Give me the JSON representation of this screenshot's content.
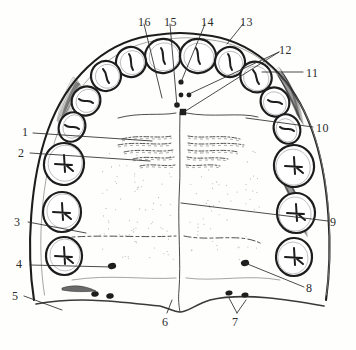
{
  "figure": {
    "kind": "line-drawing",
    "ink_color": "#1d1d1d",
    "paper_color": "#fefefd",
    "label_color": "#2b2b2b"
  },
  "labels": [
    {
      "id": "1",
      "text": "1",
      "x": 22,
      "y": 126
    },
    {
      "id": "2",
      "text": "2",
      "x": 18,
      "y": 147
    },
    {
      "id": "3",
      "text": "3",
      "x": 14,
      "y": 216
    },
    {
      "id": "4",
      "text": "4",
      "x": 16,
      "y": 258
    },
    {
      "id": "5",
      "text": "5",
      "x": 12,
      "y": 290
    },
    {
      "id": "6",
      "text": "6",
      "x": 162,
      "y": 316
    },
    {
      "id": "7",
      "text": "7",
      "x": 232,
      "y": 316
    },
    {
      "id": "8",
      "text": "8",
      "x": 306,
      "y": 282
    },
    {
      "id": "9",
      "text": "9",
      "x": 330,
      "y": 216
    },
    {
      "id": "10",
      "text": "10",
      "x": 316,
      "y": 122
    },
    {
      "id": "11",
      "text": "11",
      "x": 306,
      "y": 67
    },
    {
      "id": "12",
      "text": "12",
      "x": 279,
      "y": 44
    },
    {
      "id": "13",
      "text": "13",
      "x": 240,
      "y": 16
    },
    {
      "id": "14",
      "text": "14",
      "x": 201,
      "y": 16
    },
    {
      "id": "15",
      "text": "15",
      "x": 164,
      "y": 16
    },
    {
      "id": "16",
      "text": "16",
      "x": 138,
      "y": 16
    }
  ],
  "leaders": [
    {
      "id": "1",
      "path": "M33,133 L152,141"
    },
    {
      "id": "2",
      "path": "M30,153 L150,161"
    },
    {
      "id": "3",
      "path": "M28,222 L86,233"
    },
    {
      "id": "4",
      "path": "M30,265 L112,267"
    },
    {
      "id": "5",
      "path": "M24,296 L62,310"
    },
    {
      "id": "6",
      "path": "M167,313 L172,300"
    },
    {
      "id": "7",
      "path": "M237,313 L229,298 M237,313 L246,300"
    },
    {
      "id": "8",
      "path": "M304,287 L245,263"
    },
    {
      "id": "9",
      "path": "M328,221 L181,203"
    },
    {
      "id": "10",
      "path": "M313,127 L246,118"
    },
    {
      "id": "11",
      "path": "M303,72 L262,72"
    },
    {
      "id": "12",
      "path": "M279,52 L184,112 M279,52 L187,95"
    },
    {
      "id": "13",
      "path": "M243,24 L227,44"
    },
    {
      "id": "14",
      "path": "M205,24 L181,82"
    },
    {
      "id": "15",
      "path": "M170,24 L177,106"
    },
    {
      "id": "16",
      "path": "M144,24 L162,98"
    }
  ],
  "arch_outline": {
    "name": "palate-outline",
    "path": "M34,300 C26,250 30,180 48,130 C66,80 102,44 148,36 C162,34 176,33 180,33 C186,33 198,34 212,36 C258,44 294,80 312,130 C330,180 333,250 326,300"
  },
  "teeth_left": [
    {
      "name": "tooth-central-incisor-left",
      "cx": 163,
      "cy": 56,
      "rx": 18,
      "ry": 17,
      "rot": -8,
      "mark": "incisal"
    },
    {
      "name": "tooth-lateral-incisor-left",
      "cx": 131,
      "cy": 62,
      "rx": 15,
      "ry": 15,
      "rot": -20,
      "mark": "incisal"
    },
    {
      "name": "tooth-canine-left",
      "cx": 106,
      "cy": 76,
      "rx": 15,
      "ry": 15,
      "rot": -34,
      "mark": "cusp"
    },
    {
      "name": "tooth-first-premolar-left",
      "cx": 86,
      "cy": 101,
      "rx": 15,
      "ry": 14,
      "rot": -52,
      "mark": "ridge"
    },
    {
      "name": "tooth-second-premolar-left",
      "cx": 72,
      "cy": 127,
      "rx": 15,
      "ry": 13,
      "rot": -66,
      "mark": "ridge"
    },
    {
      "name": "tooth-first-molar-left",
      "cx": 64,
      "cy": 164,
      "rx": 21,
      "ry": 20,
      "rot": -80,
      "mark": "cross"
    },
    {
      "name": "tooth-second-molar-left",
      "cx": 62,
      "cy": 212,
      "rx": 20,
      "ry": 19,
      "rot": -88,
      "mark": "cross"
    },
    {
      "name": "tooth-third-molar-left",
      "cx": 64,
      "cy": 256,
      "rx": 19,
      "ry": 18,
      "rot": -92,
      "mark": "cross"
    }
  ],
  "teeth_right": [
    {
      "name": "tooth-central-incisor-right",
      "cx": 198,
      "cy": 56,
      "rx": 18,
      "ry": 17,
      "rot": 8,
      "mark": "incisal"
    },
    {
      "name": "tooth-lateral-incisor-right",
      "cx": 230,
      "cy": 62,
      "rx": 15,
      "ry": 15,
      "rot": 20,
      "mark": "incisal"
    },
    {
      "name": "tooth-canine-right",
      "cx": 256,
      "cy": 77,
      "rx": 16,
      "ry": 15,
      "rot": 34,
      "mark": "cusp"
    },
    {
      "name": "tooth-first-premolar-right",
      "cx": 275,
      "cy": 102,
      "rx": 15,
      "ry": 14,
      "rot": 52,
      "mark": "ridge"
    },
    {
      "name": "tooth-second-premolar-right",
      "cx": 287,
      "cy": 129,
      "rx": 15,
      "ry": 13,
      "rot": 66,
      "mark": "ridge"
    },
    {
      "name": "tooth-first-molar-right",
      "cx": 294,
      "cy": 166,
      "rx": 21,
      "ry": 20,
      "rot": 80,
      "mark": "cross"
    },
    {
      "name": "tooth-second-molar-right",
      "cx": 296,
      "cy": 213,
      "rx": 20,
      "ry": 19,
      "rot": 88,
      "mark": "cross"
    },
    {
      "name": "tooth-third-molar-right",
      "cx": 294,
      "cy": 257,
      "rx": 19,
      "ry": 18,
      "rot": 92,
      "mark": "cross"
    }
  ],
  "midline": {
    "name": "palatine-raphe",
    "path": "M180,112 C179,140 181,170 179,200 C178,230 181,262 179,290 C178,300 179,306 180,312"
  },
  "rugae_left": [
    "M122,139 C140,134 156,139 172,136",
    "M118,145 C138,141 156,146 172,143",
    "M124,152 C142,148 158,153 173,150",
    "M133,159 C148,155 161,160 174,157",
    "M140,166 C152,163 164,167 175,165"
  ],
  "rugae_right": [
    "M188,136 C204,139 222,134 240,139",
    "M188,143 C206,146 224,141 244,145",
    "M188,150 C204,153 220,148 238,152",
    "M187,157 C200,160 214,156 228,159",
    "M186,165 C197,167 209,163 220,166"
  ],
  "papilla_dots": [
    {
      "name": "incisive-papilla-dot",
      "cx": 181,
      "cy": 82,
      "r": 2.6
    },
    {
      "name": "palatine-foramen-dot",
      "cx": 177,
      "cy": 105,
      "r": 2.8
    },
    {
      "name": "palatine-foramen-dot",
      "cx": 181,
      "cy": 95,
      "r": 2.4
    },
    {
      "name": "palatine-foramen-dot",
      "cx": 189,
      "cy": 95,
      "r": 2.4
    },
    {
      "name": "incisive-fossa-square",
      "cx": 183,
      "cy": 112,
      "r": 3.2
    }
  ],
  "gland_dots": [
    {
      "name": "greater-palatine-foramen-left",
      "cx": 112,
      "cy": 266,
      "r": 3.4
    },
    {
      "name": "greater-palatine-foramen-right",
      "cx": 245,
      "cy": 263,
      "r": 3.4
    },
    {
      "name": "lesser-palatine-foramen-left-a",
      "cx": 95,
      "cy": 294,
      "r": 3.0
    },
    {
      "name": "lesser-palatine-foramen-left-b",
      "cx": 110,
      "cy": 296,
      "r": 3.0
    },
    {
      "name": "lesser-palatine-foramen-right-a",
      "cx": 229,
      "cy": 293,
      "r": 2.8
    },
    {
      "name": "lesser-palatine-foramen-right-b",
      "cx": 245,
      "cy": 295,
      "r": 2.8
    }
  ],
  "soft_tissue_lines": [
    {
      "name": "posterior-border-left",
      "path": "M62,238 C100,234 138,238 176,236"
    },
    {
      "name": "posterior-border-right",
      "path": "M184,236 C212,242 240,232 262,244"
    },
    {
      "name": "soft-palate-edge",
      "path": "M36,304 C80,296 120,302 160,306 C168,308 174,312 180,312 C188,312 196,304 210,300 C244,292 290,300 324,306"
    },
    {
      "name": "rugae-band-upper",
      "path": "M118,118 C140,112 160,116 176,113"
    },
    {
      "name": "rugae-band-upper-right",
      "path": "M186,113 C212,118 240,112 258,117"
    },
    {
      "name": "palatal-vault-shade-l",
      "path": "M72,280 C110,274 144,280 176,278"
    },
    {
      "name": "palatal-vault-shade-r",
      "path": "M186,278 C216,282 248,274 280,280"
    }
  ],
  "shading_patches": [
    {
      "name": "tuberosity-shading-right",
      "path": "M282,72 C292,86 298,104 300,120 C294,106 286,88 278,76 Z"
    },
    {
      "name": "tuberosity-shading-right-2",
      "path": "M288,180 C298,196 304,214 304,232 C298,214 290,196 284,184 Z"
    },
    {
      "name": "tuberosity-shading-left",
      "path": "M76,82 C68,96 62,112 60,126 C66,110 72,94 80,84 Z"
    }
  ]
}
